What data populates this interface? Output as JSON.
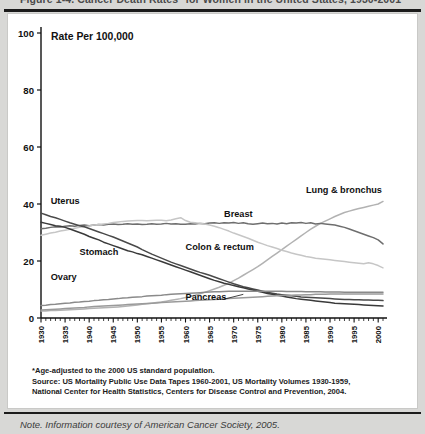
{
  "figure": {
    "title": "Figure 1-4. Cancer Death Rates* for Women in the United States, 1930-2001",
    "note": "Note. Information courtesy of American Cancer Society, 2005."
  },
  "notes": [
    "*Age-adjusted to the 2000 US standard population.",
    "Source:  US Mortality Public Use Data Tapes 1960-2001, US Mortality Volumes 1930-1959,",
    "National Center for Health Statistics, Centers for Disease Control and Prevention, 2004."
  ],
  "chart_data": {
    "type": "line",
    "title": "Rate Per 100,000",
    "xlabel": "",
    "ylabel": "Rate Per 100,000",
    "xlim": [
      1930,
      2001
    ],
    "ylim": [
      0,
      100
    ],
    "yticks": [
      0,
      20,
      40,
      60,
      80,
      100
    ],
    "xticks": [
      1930,
      1935,
      1940,
      1945,
      1950,
      1955,
      1960,
      1965,
      1970,
      1975,
      1980,
      1985,
      1990,
      1995,
      2000
    ],
    "grid": false,
    "legend_position": "inline-annotations",
    "x": [
      1930,
      1931,
      1932,
      1933,
      1934,
      1935,
      1936,
      1937,
      1938,
      1939,
      1940,
      1941,
      1942,
      1943,
      1944,
      1945,
      1946,
      1947,
      1948,
      1949,
      1950,
      1951,
      1952,
      1953,
      1954,
      1955,
      1956,
      1957,
      1958,
      1959,
      1960,
      1961,
      1962,
      1963,
      1964,
      1965,
      1966,
      1967,
      1968,
      1969,
      1970,
      1971,
      1972,
      1973,
      1974,
      1975,
      1976,
      1977,
      1978,
      1979,
      1980,
      1981,
      1982,
      1983,
      1984,
      1985,
      1986,
      1987,
      1988,
      1989,
      1990,
      1991,
      1992,
      1993,
      1994,
      1995,
      1996,
      1997,
      1998,
      1999,
      2000,
      2001
    ],
    "series": [
      {
        "name": "Lung & bronchus",
        "color": "#b2b2b2",
        "label_x": 1985,
        "label_y": 44,
        "values": [
          2.5,
          2.5,
          2.6,
          2.6,
          2.7,
          2.8,
          2.9,
          3.0,
          3.1,
          3.2,
          3.3,
          3.4,
          3.5,
          3.6,
          3.7,
          3.8,
          3.9,
          4.0,
          4.2,
          4.4,
          4.6,
          4.8,
          5.0,
          5.2,
          5.4,
          5.6,
          5.9,
          6.2,
          6.5,
          6.8,
          7.2,
          7.6,
          8.0,
          8.5,
          9.0,
          9.6,
          10.2,
          10.8,
          11.5,
          12.2,
          13.1,
          14.0,
          15.0,
          16.0,
          17.0,
          18.0,
          19.2,
          20.4,
          21.6,
          22.8,
          24.0,
          25.2,
          26.4,
          27.6,
          28.8,
          30.0,
          31.2,
          32.2,
          33.2,
          34.0,
          34.8,
          35.6,
          36.3,
          37.0,
          37.5,
          38.0,
          38.4,
          38.8,
          39.2,
          39.6,
          40.0,
          40.9
        ]
      },
      {
        "name": "Breast",
        "color": "#6e6e6e",
        "label_x": 1968,
        "label_y": 35.5,
        "values": [
          31.3,
          31.5,
          31.8,
          32.0,
          31.9,
          32.2,
          32.4,
          32.2,
          32.5,
          32.6,
          32.4,
          32.6,
          32.8,
          32.6,
          32.9,
          33.0,
          32.8,
          32.9,
          33.1,
          32.9,
          33.0,
          32.8,
          32.9,
          33.1,
          32.9,
          33.0,
          33.2,
          33.0,
          33.1,
          32.9,
          32.9,
          33.1,
          33.0,
          33.2,
          33.1,
          33.3,
          33.4,
          33.2,
          33.4,
          33.3,
          33.5,
          33.2,
          33.4,
          33.1,
          32.9,
          33.1,
          33.3,
          33.1,
          33.2,
          33.0,
          33.3,
          33.1,
          33.4,
          33.3,
          33.5,
          33.2,
          33.4,
          33.0,
          33.2,
          33.0,
          32.8,
          32.6,
          32.2,
          31.8,
          31.2,
          30.6,
          30.0,
          29.4,
          28.8,
          28.2,
          27.4,
          26.0
        ]
      },
      {
        "name": "Colon & rectum",
        "color": "#c6c6c6",
        "label_x": 1960,
        "label_y": 24,
        "values": [
          29.0,
          29.4,
          29.8,
          30.1,
          30.5,
          30.8,
          31.1,
          31.5,
          31.8,
          32.0,
          32.3,
          32.6,
          32.8,
          33.0,
          33.2,
          33.5,
          33.7,
          33.9,
          34.0,
          34.1,
          34.2,
          34.2,
          34.1,
          34.2,
          34.3,
          34.3,
          34.1,
          34.4,
          34.8,
          35.2,
          34.2,
          33.6,
          33.4,
          33.2,
          33.0,
          32.6,
          32.2,
          31.7,
          31.1,
          30.5,
          29.8,
          29.2,
          28.6,
          28.0,
          27.3,
          26.6,
          26.0,
          25.4,
          24.9,
          24.4,
          23.8,
          23.3,
          22.8,
          22.4,
          22.0,
          21.6,
          21.3,
          21.0,
          20.8,
          20.6,
          20.4,
          20.2,
          20.0,
          19.8,
          19.6,
          19.4,
          19.2,
          19.0,
          19.4,
          19.0,
          18.4,
          17.6
        ]
      },
      {
        "name": "Uterus",
        "color": "#4a4a4a",
        "label_x": 1932,
        "label_y": 40,
        "values": [
          36.8,
          36.2,
          35.6,
          35.2,
          34.6,
          34.0,
          33.4,
          32.9,
          32.4,
          32.0,
          31.4,
          30.8,
          30.2,
          29.6,
          29.0,
          28.4,
          27.7,
          27.0,
          26.3,
          25.6,
          24.9,
          24.0,
          23.2,
          22.4,
          21.7,
          21.0,
          20.3,
          19.6,
          19.0,
          18.4,
          17.8,
          17.2,
          16.6,
          16.0,
          15.5,
          15.0,
          14.4,
          13.8,
          13.2,
          12.6,
          12.0,
          11.5,
          11.0,
          10.6,
          10.2,
          9.8,
          9.4,
          9.0,
          8.7,
          8.4,
          8.2,
          8.0,
          7.8,
          7.6,
          7.4,
          7.3,
          7.2,
          7.1,
          7.0,
          6.9,
          6.8,
          6.7,
          6.6,
          6.5,
          6.5,
          6.4,
          6.4,
          6.3,
          6.3,
          6.2,
          6.2,
          6.1
        ]
      },
      {
        "name": "Stomach",
        "color": "#3a3a3a",
        "label_x": 1938,
        "label_y": 22,
        "values": [
          33.6,
          33.2,
          32.8,
          32.4,
          32.2,
          31.8,
          31.2,
          30.6,
          30.0,
          29.4,
          28.6,
          28.0,
          27.4,
          26.6,
          26.0,
          25.4,
          24.8,
          24.2,
          23.6,
          23.2,
          22.6,
          22.2,
          21.6,
          21.0,
          20.4,
          19.8,
          19.2,
          18.6,
          18.0,
          17.4,
          16.8,
          16.2,
          15.6,
          15.0,
          14.4,
          13.8,
          13.2,
          12.7,
          12.2,
          11.8,
          11.4,
          11.0,
          10.6,
          10.2,
          9.8,
          9.4,
          9.0,
          8.6,
          8.3,
          8.0,
          7.7,
          7.4,
          7.1,
          6.8,
          6.6,
          6.4,
          6.2,
          6.0,
          5.8,
          5.6,
          5.4,
          5.2,
          5.1,
          5.0,
          4.9,
          4.8,
          4.7,
          4.6,
          4.5,
          4.4,
          4.3,
          4.2
        ]
      },
      {
        "name": "Ovary",
        "color": "#8a8a8a",
        "label_x": 1932,
        "label_y": 13.5,
        "values": [
          4.4,
          4.5,
          4.7,
          4.8,
          5.0,
          5.2,
          5.3,
          5.5,
          5.6,
          5.8,
          5.9,
          6.1,
          6.2,
          6.4,
          6.5,
          6.7,
          6.8,
          7.0,
          7.1,
          7.3,
          7.4,
          7.5,
          7.7,
          7.8,
          7.9,
          8.0,
          8.2,
          8.3,
          8.4,
          8.5,
          8.6,
          8.7,
          8.8,
          8.9,
          9.0,
          9.1,
          9.2,
          9.2,
          9.3,
          9.4,
          9.4,
          9.4,
          9.4,
          9.4,
          9.4,
          9.4,
          9.4,
          9.4,
          9.4,
          9.4,
          9.4,
          9.3,
          9.3,
          9.3,
          9.3,
          9.2,
          9.2,
          9.2,
          9.2,
          9.1,
          9.1,
          9.1,
          9.1,
          9.0,
          9.0,
          9.0,
          9.0,
          9.0,
          9.0,
          9.0,
          9.0,
          9.0
        ]
      },
      {
        "name": "Pancreas",
        "color": "#9a9a9a",
        "label_x": 1960,
        "label_y": 6.2,
        "values": [
          2.8,
          2.9,
          3.0,
          3.1,
          3.2,
          3.3,
          3.4,
          3.5,
          3.6,
          3.7,
          3.9,
          4.0,
          4.1,
          4.2,
          4.3,
          4.4,
          4.5,
          4.6,
          4.7,
          4.8,
          4.9,
          5.0,
          5.1,
          5.2,
          5.3,
          5.4,
          5.5,
          5.6,
          5.7,
          5.8,
          5.9,
          6.0,
          6.1,
          6.2,
          6.3,
          6.4,
          6.5,
          6.6,
          6.7,
          6.8,
          6.9,
          7.0,
          7.1,
          7.2,
          7.3,
          7.4,
          7.5,
          7.6,
          7.7,
          7.8,
          7.9,
          8.0,
          8.0,
          8.1,
          8.1,
          8.2,
          8.2,
          8.3,
          8.3,
          8.3,
          8.4,
          8.4,
          8.4,
          8.4,
          8.4,
          8.4,
          8.4,
          8.4,
          8.4,
          8.4,
          8.4,
          8.4
        ]
      }
    ]
  }
}
